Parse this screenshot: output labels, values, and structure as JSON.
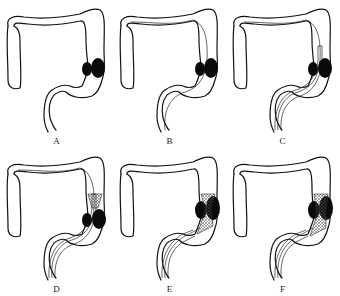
{
  "figure": {
    "colors": {
      "line": "#111111",
      "tumor": "#0a0a0a",
      "stent_mesh": "#555555",
      "background": "#ffffff"
    },
    "panels": [
      {
        "id": "A",
        "label": "A",
        "step": "colon with obstructing tumor at splenic flexure/descending colon",
        "guidewire": false,
        "catheter": false,
        "stent": "none"
      },
      {
        "id": "B",
        "label": "B",
        "step": "guidewire passed through stricture",
        "guidewire": true,
        "catheter": false,
        "stent": "none"
      },
      {
        "id": "C",
        "label": "C",
        "step": "catheter/delivery system advanced over guidewire",
        "guidewire": true,
        "catheter": true,
        "stent": "none"
      },
      {
        "id": "D",
        "label": "D",
        "step": "stent begins deployment proximally",
        "guidewire": true,
        "catheter": true,
        "stent": "partial"
      },
      {
        "id": "E",
        "label": "E",
        "step": "stent fully deployed across tumor",
        "guidewire": true,
        "catheter": true,
        "stent": "full"
      },
      {
        "id": "F",
        "label": "F",
        "step": "stent in place, delivery system withdrawing",
        "guidewire": true,
        "catheter": true,
        "stent": "full"
      }
    ]
  }
}
